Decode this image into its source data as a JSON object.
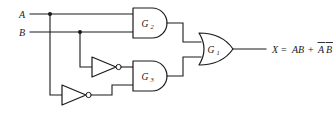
{
  "diagram": {
    "type": "logic-circuit",
    "title": "",
    "background_color": "#ffffff",
    "line_color": "#1a1a1a"
  },
  "inputs": [
    {
      "id": "A",
      "label": "A",
      "x": 22,
      "y": 14
    },
    {
      "id": "B",
      "label": "B",
      "x": 22,
      "y": 32
    }
  ],
  "gates": [
    {
      "id": "G2",
      "kind": "AND",
      "label": "G",
      "subscript": "2",
      "inputs": [
        "A",
        "B"
      ],
      "output_expression": "AB"
    },
    {
      "id": "G3",
      "kind": "AND",
      "label": "G",
      "subscript": "3",
      "inputs": [
        "B-not",
        "A-not"
      ],
      "output_expression": "A'B'"
    },
    {
      "id": "G1",
      "kind": "OR",
      "label": "G",
      "subscript": "1",
      "inputs": [
        "G2",
        "G3"
      ],
      "output_expression": "X"
    }
  ],
  "inverters": [
    {
      "id": "inv-B",
      "input": "B",
      "output": "B-not"
    },
    {
      "id": "inv-A",
      "input": "A",
      "output": "A-not"
    }
  ],
  "output": {
    "name": "X",
    "equals": "=",
    "term1": "AB",
    "plus": "+",
    "term2_a": "A",
    "term2_b": "B",
    "full_text": "X = AB + AB (A and B complemented in second term)"
  }
}
